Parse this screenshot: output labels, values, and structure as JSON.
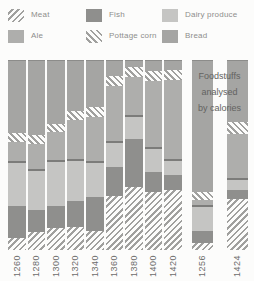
{
  "legend": {
    "items": [
      {
        "label": "Meat",
        "swatch": "hatch-meat"
      },
      {
        "label": "Fish",
        "swatch": "fish"
      },
      {
        "label": "Dairy produce",
        "swatch": "dairy"
      },
      {
        "label": "Ale",
        "swatch": "ale"
      },
      {
        "label": "Pottage corn",
        "swatch": "hatch-pottage"
      },
      {
        "label": "Bread",
        "swatch": "bread"
      }
    ]
  },
  "note": {
    "lines": [
      "Foodstuffs",
      "analysed",
      "by calories"
    ]
  },
  "palette": {
    "Bread": "#a5a5a3",
    "Ale": "#aeaeac",
    "Dairy produce": "#c5c5c3",
    "Fish": "#8f8f8d",
    "hatch_stripe": "#a0a09e",
    "divider_line": "#7c7c7a",
    "background": "#fcfcfb"
  },
  "chart_data": {
    "type": "bar",
    "subtype": "stacked-100-percent",
    "title": "",
    "xlabel": "",
    "ylabel": "",
    "unit": "percent of bar height (estimated from pixels)",
    "legend_position": "top",
    "grid": false,
    "segments_order_top_to_bottom": [
      "Bread",
      "Pottage corn",
      "Ale",
      "Dairy produce",
      "Fish",
      "Meat"
    ],
    "annotation": "Foodstuffs analysed by calories (applies to the two separated bars, 1256 and 1424)",
    "groups": [
      {
        "label": "1260",
        "group": "by-value",
        "values": {
          "Bread": 38.2,
          "Pottage corn": 4.7,
          "Ale": 9.9,
          "Dairy produce": 24.1,
          "Fish": 16.8,
          "Meat": 6.3
        }
      },
      {
        "label": "1280",
        "group": "by-value",
        "values": {
          "Bread": 39.3,
          "Pottage corn": 4.7,
          "Ale": 13.1,
          "Dairy produce": 22.0,
          "Fish": 11.5,
          "Meat": 9.4
        }
      },
      {
        "label": "1300",
        "group": "by-value",
        "values": {
          "Bread": 33.5,
          "Pottage corn": 4.2,
          "Ale": 14.7,
          "Dairy produce": 24.1,
          "Fish": 12.0,
          "Meat": 11.5
        }
      },
      {
        "label": "1320",
        "group": "by-value",
        "values": {
          "Bread": 26.2,
          "Pottage corn": 5.2,
          "Ale": 20.4,
          "Dairy produce": 22.5,
          "Fish": 13.6,
          "Meat": 12.1
        }
      },
      {
        "label": "1340",
        "group": "by-value",
        "values": {
          "Bread": 24.6,
          "Pottage corn": 5.2,
          "Ale": 23.0,
          "Dairy produce": 19.0,
          "Fish": 18.3,
          "Meat": 9.9
        }
      },
      {
        "label": "1360",
        "group": "by-value",
        "values": {
          "Bread": 7.9,
          "Pottage corn": 5.2,
          "Ale": 29.3,
          "Dairy produce": 13.6,
          "Fish": 15.7,
          "Meat": 28.3
        }
      },
      {
        "label": "1380",
        "group": "by-value",
        "values": {
          "Bread": 3.1,
          "Pottage corn": 5.2,
          "Ale": 20.5,
          "Dairy produce": 12.6,
          "Fish": 25.1,
          "Meat": 33.5
        }
      },
      {
        "label": "1400",
        "group": "by-value",
        "values": {
          "Bread": 5.2,
          "Pottage corn": 5.2,
          "Ale": 35.1,
          "Dairy produce": 13.1,
          "Fish": 10.5,
          "Meat": 30.9
        }
      },
      {
        "label": "1420",
        "group": "by-value",
        "values": {
          "Bread": 4.7,
          "Pottage corn": 5.2,
          "Ale": 41.9,
          "Dairy produce": 8.4,
          "Fish": 7.9,
          "Meat": 31.9
        }
      },
      {
        "label": "1256",
        "group": "by-calories",
        "values": {
          "Bread": 69.1,
          "Pottage corn": 4.7,
          "Ale": 2.6,
          "Dairy produce": 13.6,
          "Fish": 6.3,
          "Meat": 3.7
        }
      },
      {
        "label": "1424",
        "group": "by-calories",
        "values": {
          "Bread": 32.5,
          "Pottage corn": 6.3,
          "Ale": 23.0,
          "Dairy produce": 6.3,
          "Fish": 4.7,
          "Meat": 27.2
        }
      }
    ]
  }
}
